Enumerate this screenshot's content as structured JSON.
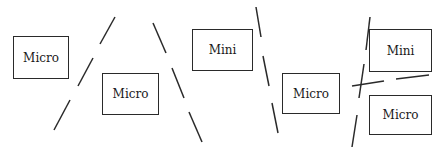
{
  "diagram": {
    "boxes": [
      {
        "id": "b1",
        "label": "Micro"
      },
      {
        "id": "b2",
        "label": "Micro"
      },
      {
        "id": "b3",
        "label": "Mini"
      },
      {
        "id": "b4",
        "label": "Micro"
      },
      {
        "id": "b5",
        "label": "Mini"
      },
      {
        "id": "b6",
        "label": "Micro"
      }
    ],
    "line_color": "#2a2a2a",
    "line_style": "dashed"
  }
}
